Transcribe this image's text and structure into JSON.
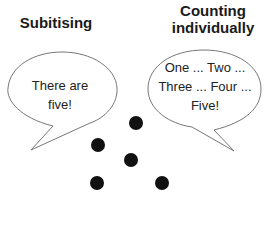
{
  "diagram": {
    "left": {
      "title": "Subitising",
      "speech": [
        "There are",
        "five!"
      ]
    },
    "right": {
      "title_lines": [
        "Counting",
        "individually"
      ],
      "speech": [
        "One ... Two ...",
        "Three ... Four ...",
        "Five!"
      ]
    },
    "dots": {
      "count": 5,
      "color": "#111111",
      "positions": [
        [
          136,
          123
        ],
        [
          98,
          145
        ],
        [
          131,
          160
        ],
        [
          97,
          183
        ],
        [
          162,
          183
        ]
      ]
    }
  }
}
